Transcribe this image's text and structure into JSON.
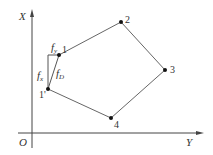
{
  "diagram": {
    "axes": {
      "vertical_label": "X",
      "horizontal_label": "Y",
      "origin_label": "O"
    },
    "points": [
      {
        "id": "1",
        "label": "1",
        "x": 59,
        "y": 55
      },
      {
        "id": "2",
        "label": "2",
        "x": 121,
        "y": 22
      },
      {
        "id": "3",
        "label": "3",
        "x": 165,
        "y": 70
      },
      {
        "id": "4",
        "label": "4",
        "x": 111,
        "y": 118
      },
      {
        "id": "1p",
        "label": "1'",
        "x": 48,
        "y": 89
      }
    ],
    "polygon_order": [
      "1",
      "2",
      "3",
      "4",
      "1p"
    ],
    "force_labels": {
      "fy": {
        "base": "f",
        "sub": "y"
      },
      "fx": {
        "base": "f",
        "sub": "x"
      },
      "fD": {
        "base": "f",
        "sub": "D"
      }
    },
    "colors": {
      "line": "#555555",
      "point": "#111111",
      "text": "#333333"
    }
  }
}
